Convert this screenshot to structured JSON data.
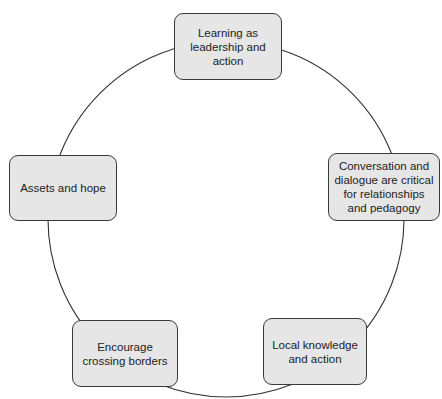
{
  "diagram": {
    "type": "cycle",
    "colors": {
      "box_fill": "#e6e6e6",
      "box_border": "#3a3a3a",
      "ring": "#333333",
      "text": "#222222"
    },
    "nodes": [
      {
        "id": "top",
        "label": "Learning as leadership and action"
      },
      {
        "id": "right",
        "label": "Conversation and dialogue are critical for relationships and pedagogy"
      },
      {
        "id": "bottom-right",
        "label": "Local knowledge and action"
      },
      {
        "id": "bottom-left",
        "label": "Encourage crossing borders"
      },
      {
        "id": "left",
        "label": "Assets and hope"
      }
    ]
  }
}
